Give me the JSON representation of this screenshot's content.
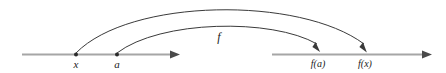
{
  "figure": {
    "kind": "function-mapping-diagram",
    "background_color": "#ffffff",
    "line_color": "#a6a6a6",
    "arc_color": "#3a3a3a",
    "label_color": "#1a1a1a"
  },
  "function_label": "f",
  "domain_axis": {
    "name": "domain-number-line",
    "points": [
      {
        "label": "x",
        "x": 76
      },
      {
        "label": "a",
        "x": 117
      }
    ]
  },
  "codomain_axis": {
    "name": "codomain-number-line",
    "points": [
      {
        "label": "f(a)",
        "x": 318
      },
      {
        "label": "f(x)",
        "x": 365
      }
    ]
  },
  "arcs": [
    {
      "name": "arc-x-to-fx",
      "from": "x",
      "to": "f(x)"
    },
    {
      "name": "arc-a-to-fa",
      "from": "a",
      "to": "f(a)"
    }
  ]
}
